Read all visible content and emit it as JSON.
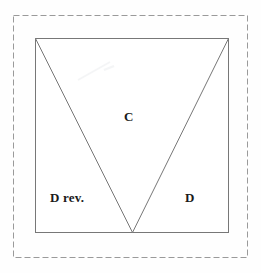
{
  "figure": {
    "title": "",
    "background_color": "#fefefe",
    "outer_frame": {
      "name": "dashed-frame",
      "style": "dashed",
      "color": "#9a9a9a",
      "x": 13,
      "y": 15,
      "width": 234,
      "height": 242,
      "dash": "6 3",
      "stroke_width": 1
    },
    "square": {
      "name": "square-outline",
      "color": "#777777",
      "x": 35,
      "y": 38,
      "width": 194,
      "height": 195,
      "stroke_width": 1
    },
    "triangle": {
      "name": "inverted-triangle",
      "color": "#777777",
      "stroke_width": 1,
      "vertices": [
        {
          "label": "top-left",
          "x": 35,
          "y": 38
        },
        {
          "label": "top-right",
          "x": 229,
          "y": 38
        },
        {
          "label": "apex",
          "x": 132,
          "y": 233
        }
      ]
    },
    "labels": [
      {
        "id": "C",
        "text": "C",
        "x": 124,
        "y": 110,
        "region": "center-triangle"
      },
      {
        "id": "D_rev",
        "text": "D rev.",
        "x": 50,
        "y": 191,
        "region": "bottom-left"
      },
      {
        "id": "D",
        "text": "D",
        "x": 185,
        "y": 191,
        "region": "bottom-right"
      }
    ]
  }
}
